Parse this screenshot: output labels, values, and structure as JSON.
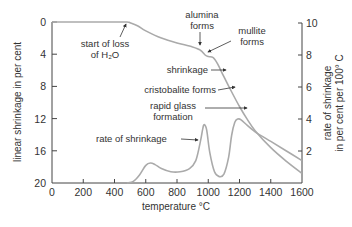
{
  "chart_data": {
    "type": "line",
    "title": "",
    "xlabel": "temperature °C",
    "ylabel_left": "linear shrinkage in per cent",
    "ylabel_right_line1": "rate of shrinkage",
    "ylabel_right_line2": "in per cent per 100° C",
    "xlim": [
      0,
      1600
    ],
    "ylim_left": [
      20,
      0
    ],
    "ylim_right": [
      0,
      10
    ],
    "left_axis_inverted": true,
    "grid": false,
    "x_ticks": [
      0,
      200,
      400,
      600,
      800,
      1000,
      1200,
      1400,
      1600
    ],
    "y_left_ticks": [
      0,
      4,
      8,
      12,
      16,
      20
    ],
    "y_right_ticks": [
      2,
      4,
      6,
      8,
      10
    ],
    "series": [
      {
        "name": "linear shrinkage",
        "axis": "left",
        "x": [
          0,
          200,
          400,
          480,
          500,
          550,
          600,
          700,
          800,
          900,
          950,
          980,
          1000,
          1030,
          1060,
          1100,
          1150,
          1200,
          1250,
          1300,
          1400,
          1500,
          1600
        ],
        "values": [
          0,
          0,
          0,
          0,
          0.1,
          0.5,
          1.1,
          2.0,
          2.6,
          3.1,
          3.5,
          4.1,
          4.3,
          4.4,
          5.2,
          6.8,
          8.7,
          10.5,
          12.1,
          13.5,
          15.6,
          17.3,
          18.8
        ]
      },
      {
        "name": "rate of shrinkage",
        "axis": "right",
        "x": [
          480,
          520,
          560,
          600,
          630,
          660,
          700,
          760,
          820,
          880,
          920,
          950,
          965,
          975,
          990,
          1010,
          1040,
          1070,
          1100,
          1130,
          1150,
          1170,
          1190,
          1210,
          1250,
          1300,
          1400,
          1500,
          1600
        ],
        "values": [
          0,
          0.1,
          0.5,
          1.1,
          1.25,
          1.15,
          0.9,
          0.7,
          0.7,
          0.9,
          1.4,
          2.6,
          3.4,
          3.65,
          3.3,
          1.9,
          0.7,
          0.4,
          0.55,
          1.6,
          3.0,
          3.8,
          4.0,
          3.95,
          3.6,
          3.2,
          2.6,
          2.0,
          1.4
        ]
      }
    ],
    "annotations": [
      {
        "text_line1": "start of loss",
        "text_line2": "of H2O",
        "points_to": "shrinkage curve at ~480 °C"
      },
      {
        "text_line1": "alumina",
        "text_line2": "forms",
        "points_to": "shrinkage curve at ~950 °C"
      },
      {
        "text_line1": "mullite",
        "text_line2": "forms",
        "points_to": "shrinkage curve at ~1000 °C"
      },
      {
        "text_line1": "shrinkage",
        "points_to": "shrinkage curve at ~1080 °C"
      },
      {
        "text_line1": "cristobalite forms",
        "points_to": "shrinkage curve at ~1150 °C"
      },
      {
        "text_line1": "rapid glass",
        "text_line2": "formation",
        "points_to": "shrinkage curve at ~1250 °C"
      },
      {
        "text_line1": "rate of shrinkage",
        "points_to": "rate curve peak at ~970 °C"
      }
    ],
    "colors": {
      "axis": "#444444",
      "curve": "#aaaaaa",
      "text": "#333333"
    }
  },
  "labels": {
    "xlabel": "temperature °C",
    "ylabel_left": "linear shrinkage in per cent",
    "ylabel_right_line1": "rate of shrinkage",
    "ylabel_right_line2": "in per cent per 100° C",
    "ann_water_1": "start of loss",
    "ann_water_2": "of H₂O",
    "ann_alumina_1": "alumina",
    "ann_alumina_2": "forms",
    "ann_mullite_1": "mullite",
    "ann_mullite_2": "forms",
    "ann_shrinkage": "shrinkage",
    "ann_cristobalite": "cristobalite forms",
    "ann_glass_1": "rapid glass",
    "ann_glass_2": "formation",
    "ann_rate": "rate of shrinkage"
  }
}
